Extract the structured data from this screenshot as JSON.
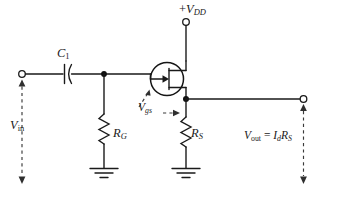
{
  "diagram": {
    "type": "schematic",
    "background_color": "#ffffff",
    "line_color": "#1a1a1a",
    "dashed_color": "#3a3a3a"
  },
  "labels": {
    "supply": {
      "plus": "+",
      "symbol": "V",
      "subscript": "DD",
      "full": "+ VDD"
    },
    "capacitor": {
      "symbol": "C",
      "subscript": "1",
      "full": "C1"
    },
    "input": {
      "symbol": "V",
      "subscript": "in",
      "full": "Vin"
    },
    "gate_resistor": {
      "symbol": "R",
      "subscript": "G",
      "full": "RG"
    },
    "source_resistor": {
      "symbol": "R",
      "subscript": "S",
      "full": "RS"
    },
    "gate_source_voltage": {
      "symbol": "V",
      "subscript": "gs",
      "full": "Vgs"
    },
    "output": {
      "symbol": "V",
      "subscript": "out",
      "equals": "=",
      "current_symbol": "I",
      "current_subscript": "d",
      "resistor_symbol": "R",
      "resistor_subscript": "S",
      "full": "Vout = Id RS"
    }
  },
  "components": {
    "transistor": {
      "name": "n-channel JFET",
      "terminals": [
        "drain",
        "gate",
        "source"
      ]
    },
    "capacitor": {
      "name": "coupling capacitor",
      "style": "one-flat-one-curved-plate"
    },
    "resistors": [
      {
        "name": "gate resistor",
        "label": "RG",
        "orientation": "vertical"
      },
      {
        "name": "source resistor",
        "label": "RS",
        "orientation": "vertical"
      }
    ],
    "grounds": [
      {
        "name": "gate-resistor-ground"
      },
      {
        "name": "source-resistor-ground"
      }
    ],
    "terminals": [
      {
        "name": "supply-terminal",
        "label": "+ VDD"
      },
      {
        "name": "input-terminal",
        "label": "Vin"
      },
      {
        "name": "output-terminal",
        "label": "Vout"
      }
    ]
  }
}
